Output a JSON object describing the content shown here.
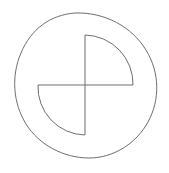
{
  "figure": {
    "background_color": "#ffffff",
    "stroke_color": "#6e6e6e",
    "stroke_width": 1,
    "canvas": {
      "width": 169,
      "height": 173
    },
    "shapes": [
      {
        "name": "outer-ellipse",
        "type": "ellipse",
        "style": "hand-drawn",
        "center": {
          "x": 84,
          "y": 86
        },
        "radius_x": 77,
        "radius_y": 62,
        "rotation_deg": -28,
        "extremes": {
          "leftmost": {
            "x": 13,
            "y": 60
          },
          "rightmost": {
            "x": 155,
            "y": 110
          },
          "topmost": {
            "x": 75,
            "y": 13
          },
          "bottommost": {
            "x": 95,
            "y": 158
          }
        },
        "path": "M 75 13 C 105 12 132 27 146 50 C 160 73 160 100 148 122 C 136 144 113 158 89 158 C 64 158 39 145 26 124 C 13 103 11 76 21 53 C 31 29 50 15 75 13 Z"
      },
      {
        "name": "cross-center",
        "type": "point",
        "x": 85,
        "y": 85
      },
      {
        "name": "upper-right-sector",
        "type": "quarter-circle-sector",
        "quadrant": "upper-right",
        "center": {
          "x": 85,
          "y": 85
        },
        "radius": 49,
        "arc_start": {
          "x": 85,
          "y": 35
        },
        "arc_end": {
          "x": 133,
          "y": 85
        },
        "path": "M 85 85 L 85 35 A 49 49 0 0 1 133 85 Z"
      },
      {
        "name": "lower-left-sector",
        "type": "quarter-circle-sector",
        "quadrant": "lower-left",
        "center": {
          "x": 85,
          "y": 85
        },
        "radius": 48,
        "arc_start": {
          "x": 85,
          "y": 135
        },
        "arc_end": {
          "x": 38,
          "y": 85
        },
        "path": "M 85 85 L 85 135 A 48 48 0 0 1 38 85 Z"
      },
      {
        "name": "vertical-axis-line",
        "type": "line",
        "from": {
          "x": 85,
          "y": 35
        },
        "to": {
          "x": 85,
          "y": 135
        }
      },
      {
        "name": "horizontal-axis-line",
        "type": "line",
        "from": {
          "x": 38,
          "y": 85
        },
        "to": {
          "x": 133,
          "y": 85
        }
      }
    ]
  }
}
